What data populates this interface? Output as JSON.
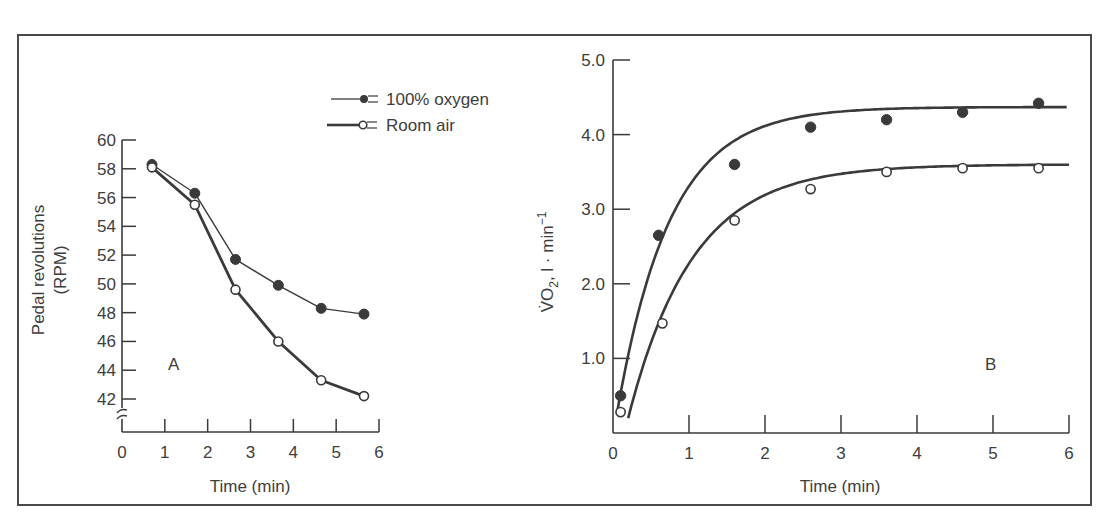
{
  "chart_data": [
    {
      "panel": "A",
      "type": "line",
      "title": "",
      "xlabel": "Time (min)",
      "ylabel": "Pedal revolutions (RPM)",
      "ylabel_lines": [
        "Pedal revolutions",
        "(RPM)"
      ],
      "xlim": [
        0,
        6
      ],
      "ylim": [
        42,
        60
      ],
      "y_axis_break": true,
      "grid": false,
      "x_ticks": [
        0,
        1,
        2,
        3,
        4,
        5,
        6
      ],
      "y_ticks": [
        42,
        44,
        46,
        48,
        50,
        52,
        54,
        56,
        58,
        60
      ],
      "panel_label": "A",
      "legend": {
        "position": "top-right",
        "entries": [
          "100% oxygen",
          "Room air"
        ]
      },
      "series": [
        {
          "name": "100% oxygen",
          "marker": "filled-circle",
          "line": "thin",
          "x": [
            0.7,
            1.7,
            2.65,
            3.65,
            4.65,
            5.65
          ],
          "values": [
            58.3,
            56.3,
            51.7,
            49.9,
            48.3,
            47.9
          ]
        },
        {
          "name": "Room air",
          "marker": "open-circle",
          "line": "thick",
          "x": [
            0.7,
            1.7,
            2.65,
            3.65,
            4.65,
            5.65
          ],
          "values": [
            58.1,
            55.5,
            49.6,
            46.0,
            43.3,
            42.2
          ]
        }
      ]
    },
    {
      "panel": "B",
      "type": "scatter",
      "title": "",
      "xlabel": "Time (min)",
      "ylabel": "V̇O2, l · min−1",
      "ylabel_parts": {
        "main": "V̇O",
        "sub": "2",
        "rest": ", l · min",
        "sup": "−1"
      },
      "xlim": [
        0,
        6
      ],
      "ylim": [
        0,
        5.0
      ],
      "grid": false,
      "x_ticks": [
        0,
        1,
        2,
        3,
        4,
        5,
        6
      ],
      "y_ticks": [
        1.0,
        2.0,
        3.0,
        4.0,
        5.0
      ],
      "y_tick_labels": [
        "1.0",
        "2.0",
        "3.0",
        "4.0",
        "5.0"
      ],
      "panel_label": "B",
      "fitted_curves": true,
      "series": [
        {
          "name": "100% oxygen",
          "marker": "filled-circle",
          "x": [
            0.1,
            0.6,
            1.6,
            2.6,
            3.6,
            4.6,
            5.6
          ],
          "values": [
            0.5,
            2.65,
            3.6,
            4.1,
            4.2,
            4.3,
            4.42
          ],
          "fit": {
            "asymptote": 4.37,
            "start": 0.25,
            "tau": 0.7,
            "t0": 0.05
          }
        },
        {
          "name": "Room air",
          "marker": "open-circle",
          "x": [
            0.1,
            0.65,
            1.6,
            2.6,
            3.6,
            4.6,
            5.6
          ],
          "values": [
            0.28,
            1.47,
            2.85,
            3.27,
            3.5,
            3.55,
            3.55
          ],
          "fit": {
            "asymptote": 3.6,
            "start": 0.2,
            "tau": 0.85,
            "t0": 0.2
          }
        }
      ]
    }
  ],
  "colors": {
    "ink": "#3a3a3a",
    "frame": "#4a4a4a",
    "background": "#ffffff"
  }
}
